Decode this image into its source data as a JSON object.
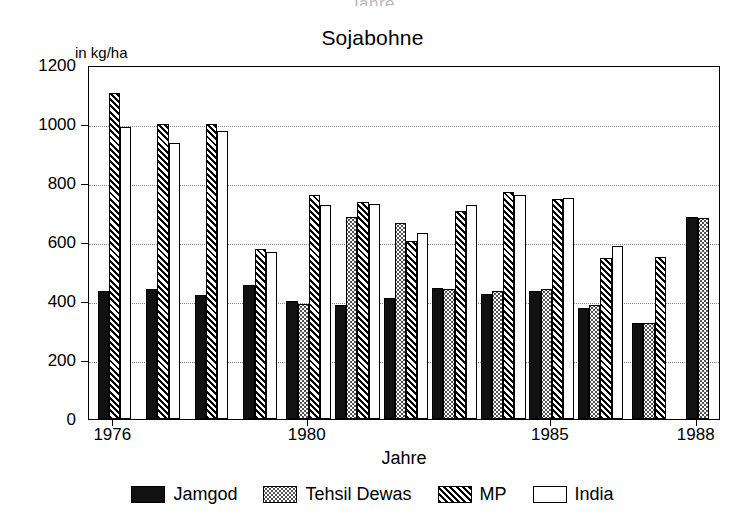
{
  "clipped_above_text": "Jahre",
  "chart_data": {
    "type": "bar",
    "title": "Sojabohne",
    "ylabel": "in kg/ha",
    "xlabel": "Jahre",
    "ylim": [
      0,
      1200
    ],
    "ytick_values": [
      0,
      200,
      400,
      600,
      800,
      1000,
      1200
    ],
    "ytick_labels": [
      "0",
      "200",
      "400",
      "600",
      "800",
      "1000",
      "1200"
    ],
    "grid": true,
    "legend_position": "bottom",
    "categories": [
      "1976",
      "1977",
      "1978",
      "1979",
      "1980",
      "1981",
      "1982",
      "1983",
      "1984",
      "1985",
      "1986",
      "1987",
      "1988"
    ],
    "xtick_labels": [
      "1976",
      "1980",
      "1985",
      "1988"
    ],
    "xtick_categories": [
      "1976",
      "1980",
      "1985",
      "1988"
    ],
    "series": [
      {
        "name": "Jamgod",
        "fill": "solid-black",
        "color": "#111111",
        "values": [
          435,
          440,
          420,
          455,
          400,
          385,
          410,
          445,
          425,
          435,
          375,
          325,
          685
        ]
      },
      {
        "name": "Tehsil Dewas",
        "fill": "dotted",
        "color": "#ffffff",
        "values": [
          null,
          null,
          null,
          null,
          390,
          685,
          665,
          440,
          435,
          440,
          385,
          325,
          680
        ]
      },
      {
        "name": "MP",
        "fill": "diagonal-hatch",
        "color": "#ffffff",
        "values": [
          1105,
          1000,
          1000,
          575,
          760,
          735,
          605,
          705,
          770,
          745,
          545,
          550,
          null
        ]
      },
      {
        "name": "India",
        "fill": "white",
        "color": "#ffffff",
        "values": [
          990,
          935,
          975,
          565,
          725,
          730,
          630,
          725,
          760,
          750,
          585,
          null,
          null
        ]
      }
    ]
  }
}
